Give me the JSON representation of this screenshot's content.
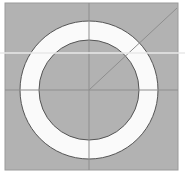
{
  "figure": {
    "name": "annulus-diagram",
    "title": "Annulus (circular ring) on shaded square",
    "canvas": {
      "width": 185,
      "height": 175,
      "background_color": "#ffffff"
    },
    "background_square": {
      "label": "shaded square field",
      "x": 5,
      "y": 3,
      "width": 173,
      "height": 167,
      "fill_color": "#b2b2b2",
      "stroke_color": "#9a9a9a",
      "stroke_width": 1
    },
    "annulus": {
      "label": "white circular ring",
      "center_x": 89,
      "center_y": 90,
      "outer_radius": 69,
      "inner_radius": 50,
      "band_fill_color": "#fafafa",
      "hole_fill_color": "#b2b2b2",
      "stroke_color": "#555555",
      "stroke_width": 1
    },
    "construction_lines": {
      "label": "faint construction lines",
      "color": "#8e8e8e",
      "width": 1,
      "vertical": {
        "label": "vertical centre line",
        "x1": 89,
        "y1": 3,
        "x2": 89,
        "y2": 170
      },
      "horizontal": {
        "label": "horizontal centre line",
        "x1": 5,
        "y1": 90,
        "x2": 178,
        "y2": 90
      },
      "radius": {
        "label": "diagonal radius line to upper right",
        "x1": 89,
        "y1": 90,
        "x2": 177,
        "y2": 8
      }
    },
    "scan_artifact": {
      "label": "light horizontal scan streak",
      "y": 52,
      "height": 2,
      "color": "#e8e8e8"
    }
  }
}
